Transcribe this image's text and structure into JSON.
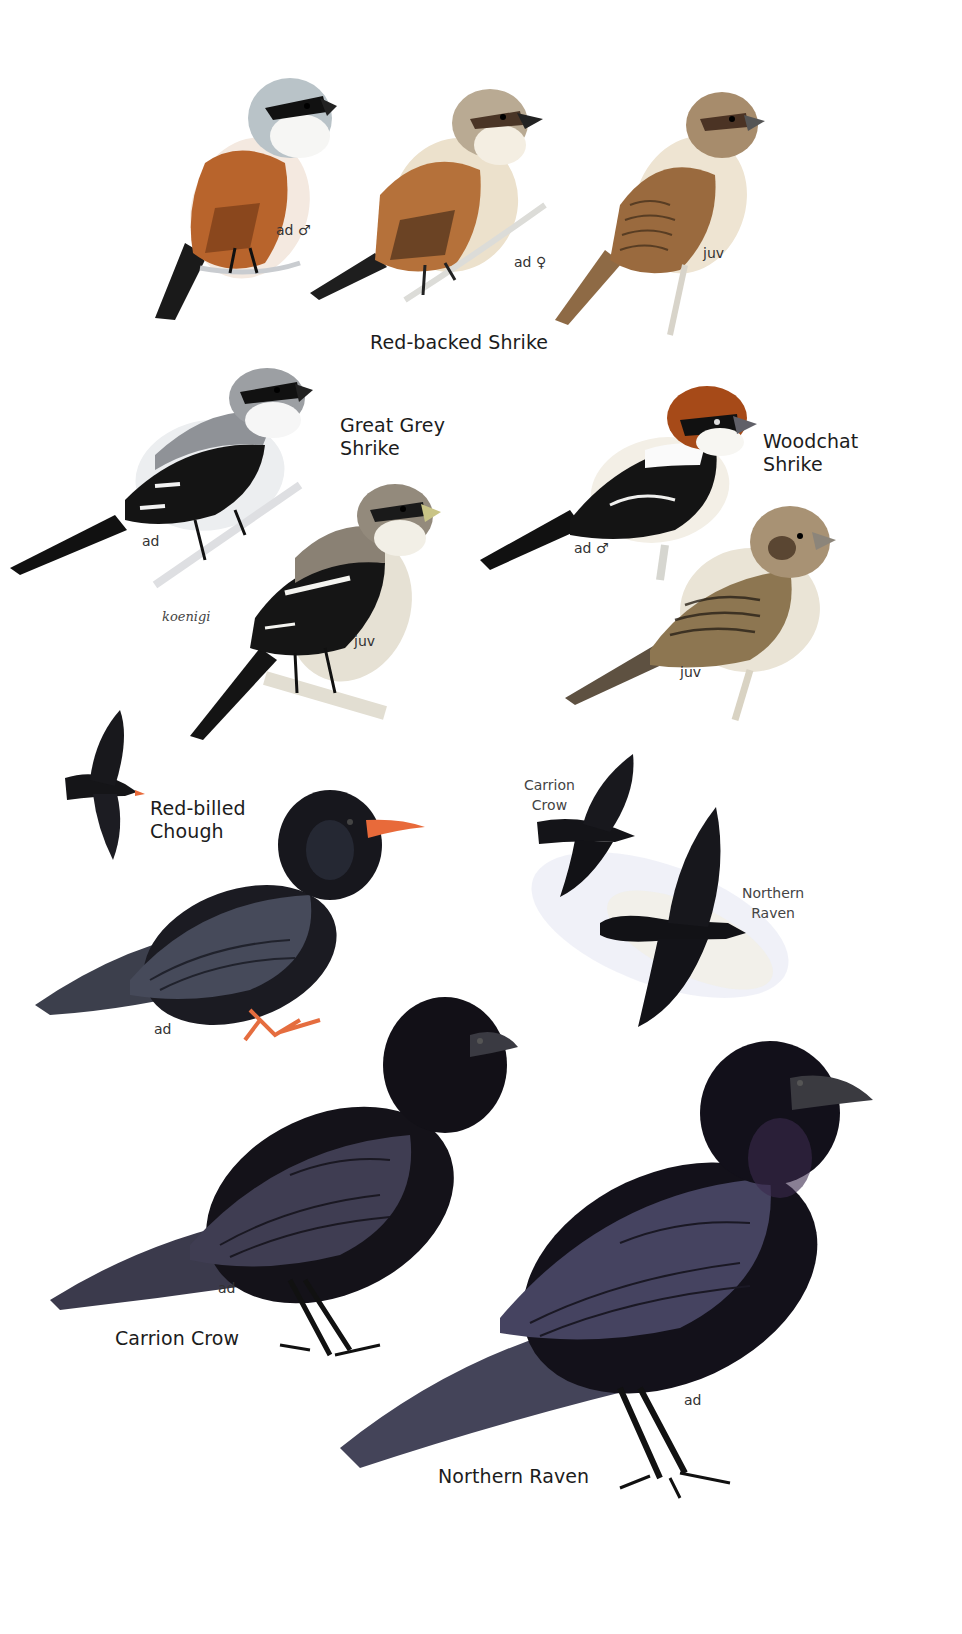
{
  "plate": {
    "background": "#ffffff",
    "species": [
      {
        "name": "Red-backed Shrike",
        "figures": [
          {
            "label": "ad ♂",
            "colors": {
              "head": "#b9c3c8",
              "back": "#b8642c",
              "belly": "#f4e9e0",
              "mask": "#111111",
              "tail": "#1a1a1a"
            }
          },
          {
            "label": "ad ♀",
            "colors": {
              "head": "#b9aa93",
              "back": "#b5713a",
              "belly": "#ece1cc",
              "mask": "#4a3526",
              "tail": "#1e1e1e"
            }
          },
          {
            "label": "juv",
            "colors": {
              "head": "#a78c6c",
              "back": "#9a6a3e",
              "belly": "#eee4d2",
              "mask": "#4b3324",
              "tail": "#8e6a45"
            }
          }
        ]
      },
      {
        "name": "Great Grey\nShrike",
        "figures": [
          {
            "label": "ad",
            "colors": {
              "head": "#9c9fa3",
              "back": "#8f9297",
              "belly": "#eceef0",
              "mask": "#111111",
              "wing": "#141414",
              "tail": "#111111"
            }
          },
          {
            "label": "juv",
            "colors": {
              "head": "#938a7c",
              "back": "#8a8174",
              "belly": "#e6e1d4",
              "mask": "#1a1a1a",
              "wing": "#151515",
              "tail": "#141414"
            }
          }
        ],
        "subspecies_label": "koenigi"
      },
      {
        "name": "Woodchat\nShrike",
        "figures": [
          {
            "label": "ad ♂",
            "colors": {
              "head": "#a64a18",
              "back": "#141414",
              "belly": "#f3efe6",
              "mask": "#111111",
              "tail": "#111111"
            }
          },
          {
            "label": "juv",
            "colors": {
              "head": "#a89274",
              "back": "#8d7651",
              "belly": "#eae4d6",
              "mask": "#5a4632",
              "tail": "#5e5141"
            }
          }
        ]
      },
      {
        "name": "Red-billed\nChough",
        "figures": [
          {
            "label": "",
            "pose": "flight"
          },
          {
            "label": "ad",
            "colors": {
              "body": "#1b1b22",
              "wing": "#3c3f4c",
              "bill": "#e86a3a",
              "legs": "#e56d3f"
            }
          }
        ]
      },
      {
        "name": "Carrion Crow",
        "flight_label": "Carrion\nCrow",
        "figures": [
          {
            "label": "",
            "pose": "flight"
          },
          {
            "label": "ad",
            "colors": {
              "body": "#141219",
              "wing": "#3b3a4c",
              "bill": "#2a2a30"
            }
          }
        ]
      },
      {
        "name": "Northern Raven",
        "flight_label": "Northern\nRaven",
        "figures": [
          {
            "label": "",
            "pose": "flight"
          },
          {
            "label": "ad",
            "colors": {
              "body": "#13111a",
              "wing": "#444459",
              "bill": "#3a3a40",
              "throat": "#3a2a4c"
            }
          }
        ]
      }
    ]
  }
}
